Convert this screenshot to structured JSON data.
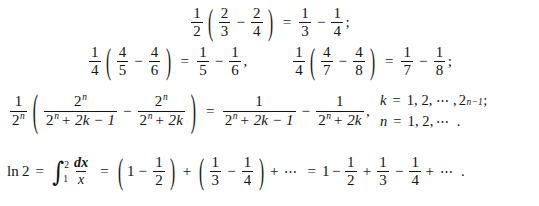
{
  "document": {
    "type": "mathematical-derivation",
    "background_color": "#ffffff",
    "text_color": "#141414",
    "line_count": 4
  },
  "symbols": {
    "minus": "−",
    "plus": "+",
    "equals": "=",
    "ellipsis": "⋯",
    "lparen": "(",
    "rparen": ")",
    "integral": "∫",
    "semicolon": ";",
    "comma": ",",
    "period": ".",
    "base": "2",
    "var_n": "n",
    "var_k": "k",
    "var_x": "x",
    "exp_n": "n",
    "exp_n_minus_1": "n−1",
    "dx": "dx",
    "ln": "ln",
    "two": "2",
    "one": "1",
    "k_term": "2k",
    "k_term_minus_1": "2k − 1"
  },
  "line1": {
    "coefficient": {
      "num": "1",
      "den": "2"
    },
    "paren_term1": {
      "num": "2",
      "den": "3"
    },
    "paren_term2": {
      "num": "2",
      "den": "4"
    },
    "result_term1": {
      "num": "1",
      "den": "3"
    },
    "result_term2": {
      "num": "1",
      "den": "4"
    },
    "terminator": ";"
  },
  "line2": {
    "equation_a": {
      "coefficient": {
        "num": "1",
        "den": "4"
      },
      "paren_term1": {
        "num": "4",
        "den": "5"
      },
      "paren_term2": {
        "num": "4",
        "den": "6"
      },
      "result_term1": {
        "num": "1",
        "den": "5"
      },
      "result_term2": {
        "num": "1",
        "den": "6"
      },
      "terminator": ","
    },
    "equation_b": {
      "coefficient": {
        "num": "1",
        "den": "4"
      },
      "paren_term1": {
        "num": "4",
        "den": "7"
      },
      "paren_term2": {
        "num": "4",
        "den": "8"
      },
      "result_term1": {
        "num": "1",
        "den": "7"
      },
      "result_term2": {
        "num": "1",
        "den": "8"
      },
      "terminator": ";"
    }
  },
  "line3": {
    "coefficient": {
      "num": "1",
      "den_base": "2",
      "den_exp": "n"
    },
    "paren_term1": {
      "num_base": "2",
      "num_exp": "n",
      "den_base": "2",
      "den_exp": "n",
      "den_rest": "+ 2k − 1"
    },
    "paren_term2": {
      "num_base": "2",
      "num_exp": "n",
      "den_base": "2",
      "den_exp": "n",
      "den_rest": "+ 2k"
    },
    "result_term1": {
      "num": "1",
      "den_base": "2",
      "den_exp": "n",
      "den_rest": "+ 2k − 1"
    },
    "result_term2": {
      "num": "1",
      "den_base": "2",
      "den_exp": "n",
      "den_rest": "+ 2k"
    },
    "terminator": ",",
    "conditions": {
      "k": {
        "var": "k",
        "equals": "=",
        "values": "1, 2,",
        "dots": "⋯",
        "comma": ",",
        "bound_base": "2",
        "bound_exp": "n−1",
        "terminator": ";"
      },
      "n": {
        "var": "n",
        "equals": "=",
        "values": "1, 2,",
        "dots": "⋯",
        "terminator": "."
      }
    }
  },
  "line4": {
    "lhs": {
      "ln": "ln",
      "arg": "2"
    },
    "integral": {
      "symbol": "∫",
      "upper": "2",
      "lower": "1",
      "num": "dx",
      "den": "x"
    },
    "group1": {
      "first": "1",
      "op": "−",
      "term": {
        "num": "1",
        "den": "2"
      }
    },
    "join_op": "+",
    "group2": {
      "term1": {
        "num": "1",
        "den": "3"
      },
      "op": "−",
      "term2": {
        "num": "1",
        "den": "4"
      }
    },
    "tail_op": "+",
    "tail_dots": "⋯",
    "series": {
      "first": "1",
      "op1": "−",
      "term1": {
        "num": "1",
        "den": "2"
      },
      "op2": "+",
      "term2": {
        "num": "1",
        "den": "3"
      },
      "op3": "−",
      "term3": {
        "num": "1",
        "den": "4"
      },
      "op4": "+",
      "dots": "⋯",
      "terminator": "."
    }
  }
}
